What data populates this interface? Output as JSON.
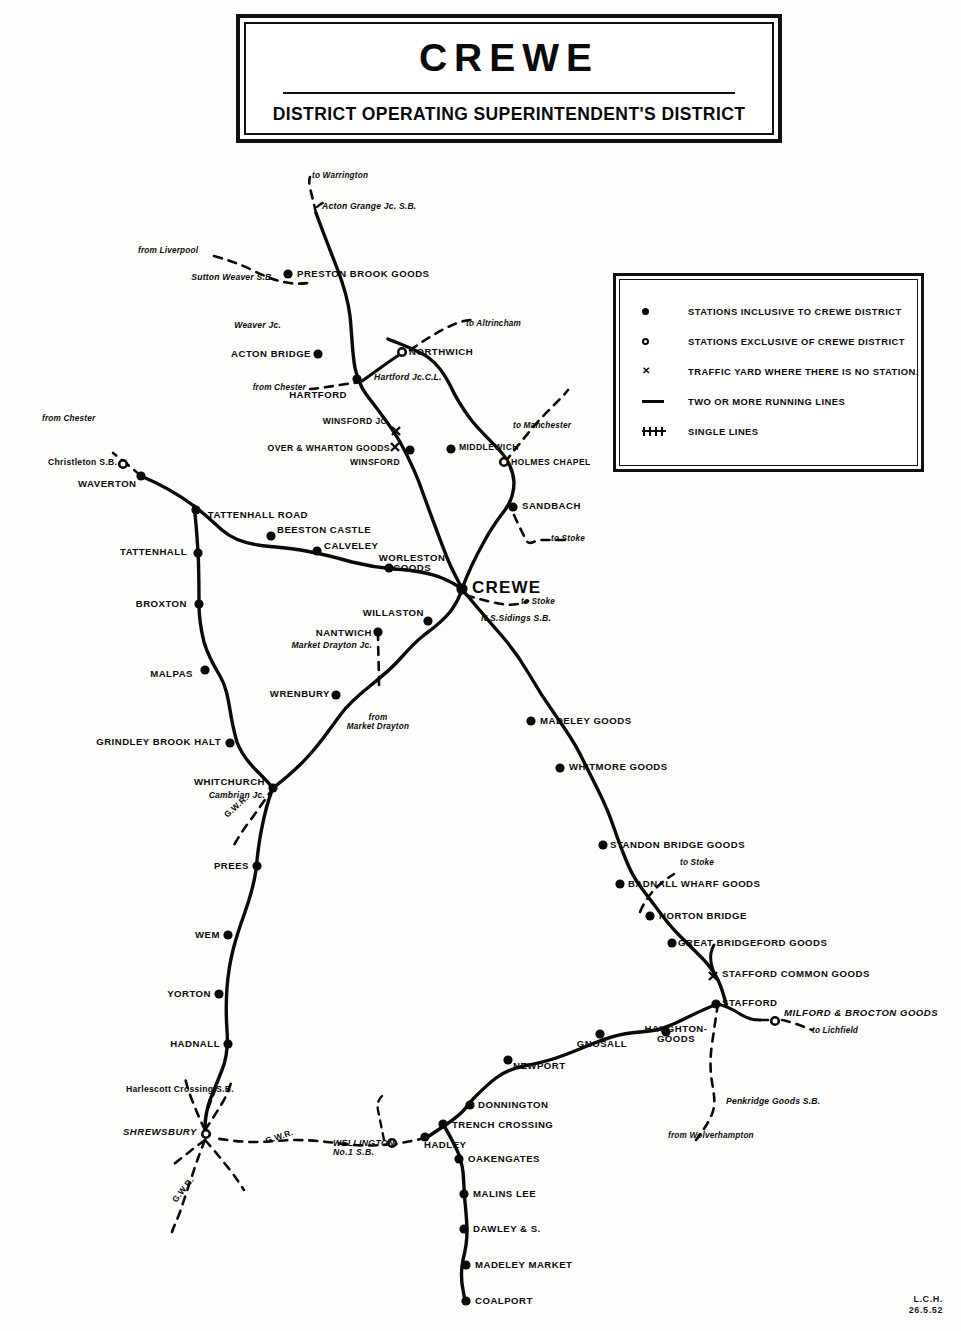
{
  "title": {
    "main": "CREWE",
    "sub": "DISTRICT  OPERATING  SUPERINTENDENT'S  DISTRICT"
  },
  "legend": {
    "items": [
      {
        "symbol": "filled-circle",
        "label": "STATIONS INCLUSIVE TO CREWE DISTRICT"
      },
      {
        "symbol": "open-circle",
        "label": "STATIONS EXCLUSIVE OF CREWE DISTRICT"
      },
      {
        "symbol": "x-mark",
        "label": "TRAFFIC YARD WHERE THERE IS NO STATION."
      },
      {
        "symbol": "solid-line",
        "label": "TWO OR MORE RUNNING LINES"
      },
      {
        "symbol": "hatched-line",
        "label": "SINGLE LINES"
      }
    ]
  },
  "stations": {
    "preston_brook_goods": "PRESTON BROOK GOODS",
    "acton_bridge": "ACTON BRIDGE",
    "hartford": "HARTFORD",
    "northwich": "NORTHWICH",
    "winsford_jc": "WINSFORD JC.",
    "over_and_wharton_goods": "OVER & WHARTON GOODS",
    "winsford": "WINSFORD",
    "middlewich": "MIDDLEWICH",
    "holmes_chapel": "HOLMES CHAPEL",
    "sandbach": "SANDBACH",
    "crewe": "CREWE",
    "waverton": "WAVERTON",
    "tattenhall_road": "TATTENHALL ROAD",
    "beeston_castle": "BEESTON CASTLE",
    "calveley": "CALVELEY",
    "worleston_goods": "WORLESTON GOODS",
    "tattenhall": "TATTENHALL",
    "broxton": "BROXTON",
    "malpas": "MALPAS",
    "grindley_brook_halt": "GRINDLEY BROOK HALT",
    "whitchurch": "WHITCHURCH",
    "willaston": "WILLASTON",
    "nantwich": "NANTWICH",
    "wrenbury": "WRENBURY",
    "prees": "PREES",
    "wem": "WEM",
    "yorton": "YORTON",
    "hadnall": "HADNALL",
    "shrewsbury": "SHREWSBURY",
    "madeley_goods": "MADELEY GOODS",
    "whitmore_goods": "WHITMORE GOODS",
    "standon_bridge_goods": "STANDON BRIDGE GOODS",
    "badnall_wharf_goods": "BADNALL WHARF GOODS",
    "norton_bridge": "NORTON BRIDGE",
    "great_bridgeford_goods": "GREAT BRIDGEFORD GOODS",
    "stafford_common_goods": "STAFFORD COMMON GOODS",
    "stafford": "STAFFORD",
    "milford_and_brocton_goods": "MILFORD & BROCTON GOODS",
    "haughton_goods": "HAUGHTON-GOODS",
    "gnosall": "GNOSALL",
    "newport": "NEWPORT",
    "donnington": "DONNINGTON",
    "trench_crossing": "TRENCH CROSSING",
    "hadley": "HADLEY",
    "oakengates": "OAKENGATES",
    "malins_lee": "MALINS LEE",
    "dawley_and_s": "DAWLEY & S.",
    "madeley_market": "MADELEY MARKET",
    "coalport": "COALPORT"
  },
  "junctions": {
    "acton_grange_jc_sb": "Acton Grange Jc. S.B.",
    "sutton_weaver_sb": "Sutton Weaver S.B.",
    "weaver_jc": "Weaver Jc.",
    "hartford_jc_cl": "Hartford Jc.C.L.",
    "christleton_sb": "Christleton S.B.",
    "market_drayton_jc": "Market Drayton Jc.",
    "cambrian_jc": "Cambrian Jc.",
    "ns_sidings_sb": "N.S.Sidings S.B.",
    "penkridge_goods_sb": "Penkridge Goods S.B.",
    "harlescott_crossing_sb": "Harlescott Crossing S.B.",
    "wellington_no1_sb": "WELLINGTON No.1 S.B."
  },
  "destinations": {
    "to_warrington": "to Warrington",
    "from_liverpool": "from Liverpool",
    "to_altrincham": "to Altrincham",
    "from_chester_hartford": "from Chester",
    "from_chester_waverton": "from Chester",
    "to_manchester": "to Manchester",
    "to_stoke_sandbach": "to Stoke",
    "to_stoke_crewe": "to Stoke",
    "to_stoke_standon": "to Stoke",
    "from_market_drayton": "from Market Drayton",
    "to_lichfield": "to Lichfield",
    "from_wolverhampton": "from Wolverhampton"
  },
  "companies": {
    "gwr_whitchurch": "G.W.R.",
    "gwr_shrewsbury_east": "G.W.R.",
    "gwr_shrewsbury_south": "G.W.R."
  },
  "signature": {
    "initials": "L.C.H.",
    "date": "26.5.52"
  },
  "colors": {
    "ink": "#0a0a0a",
    "paper": "#fdfdfb"
  }
}
